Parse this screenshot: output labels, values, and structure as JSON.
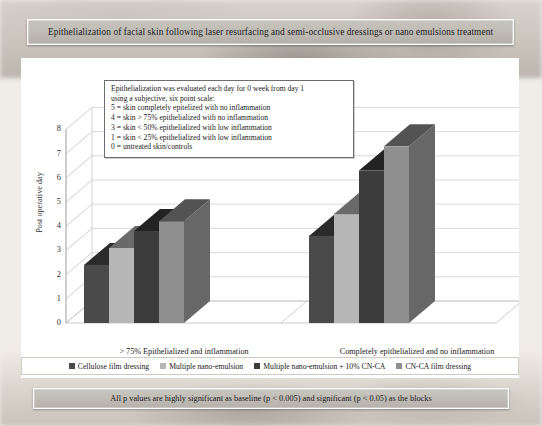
{
  "slide": {
    "title": "Epithelialization of facial skin following laser resurfacing and semi-occlusive dressings or nano emulsions treatment",
    "caption": "All p values are highly significant as baseline (p < 0.005)  and significant (p < 0.05) as the blocks"
  },
  "callout": {
    "lines": [
      "Epithelialization was evaluated each day for 0 week from day 1",
      "using a subjective, six point scale:",
      "5 = skin completely epitelized with no inflammation",
      "4 = skin > 75% epithelialized with no inflammation",
      "3 = skin < 50% epithelialized with low inflammation",
      "1 = skin < 25% epithelialized with low inflammation",
      "0 = untreated skin/controls"
    ]
  },
  "chart_data": {
    "type": "bar",
    "title": "",
    "xlabel": "",
    "ylabel": "Post operative day",
    "ylim": [
      0,
      8
    ],
    "yticks": [
      0,
      1,
      2,
      3,
      4,
      5,
      6,
      7,
      8
    ],
    "grid": true,
    "legend_position": "bottom",
    "categories": [
      "> 75% Epithelialized and inflammation",
      "Completely epithelialized and no inflammation"
    ],
    "series": [
      {
        "name": "Cellulose film dressing",
        "color": "#4a4a4a",
        "values": [
          2.4,
          3.6
        ]
      },
      {
        "name": "Multiple nano-emulsion",
        "color": "#b6b6b6",
        "values": [
          3.1,
          4.5
        ]
      },
      {
        "name": "Multiple nano-emulsion + 10% CN-CA",
        "color": "#3c3c3c",
        "values": [
          3.8,
          6.3
        ]
      },
      {
        "name": "CN-CA film dressing",
        "color": "#8f8f8f",
        "values": [
          4.2,
          7.3
        ]
      }
    ]
  },
  "colors": {
    "series1": "#4a4a4a",
    "series2": "#b6b6b6",
    "series3": "#3c3c3c",
    "series4": "#8f8f8f",
    "plot_bg": "#ffffff",
    "band": "#bfbbb5"
  }
}
